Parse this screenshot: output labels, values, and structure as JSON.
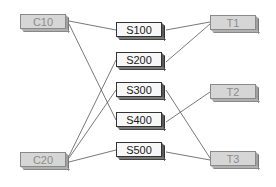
{
  "diagram": {
    "colors": {
      "line": "#555555",
      "source_fill": "#d6d6d6",
      "mid_fill": "#f7f7f7",
      "target_fill": "#d6d6d6"
    },
    "nodes": {
      "C10": {
        "label": "C10",
        "group": "left"
      },
      "C20": {
        "label": "C20",
        "group": "left"
      },
      "S100": {
        "label": "S100",
        "group": "middle"
      },
      "S200": {
        "label": "S200",
        "group": "middle"
      },
      "S300": {
        "label": "S300",
        "group": "middle"
      },
      "S400": {
        "label": "S400",
        "group": "middle"
      },
      "S500": {
        "label": "S500",
        "group": "middle"
      },
      "T1": {
        "label": "T1",
        "group": "right"
      },
      "T2": {
        "label": "T2",
        "group": "right"
      },
      "T3": {
        "label": "T3",
        "group": "right"
      }
    },
    "edges": [
      {
        "from": "C10",
        "to": "S100"
      },
      {
        "from": "C10",
        "to": "S400"
      },
      {
        "from": "C20",
        "to": "S200"
      },
      {
        "from": "C20",
        "to": "S300"
      },
      {
        "from": "C20",
        "to": "S500"
      },
      {
        "from": "S100",
        "to": "T1"
      },
      {
        "from": "S200",
        "to": "T1"
      },
      {
        "from": "S300",
        "to": "T3"
      },
      {
        "from": "S400",
        "to": "T2"
      },
      {
        "from": "S500",
        "to": "T3"
      }
    ]
  }
}
